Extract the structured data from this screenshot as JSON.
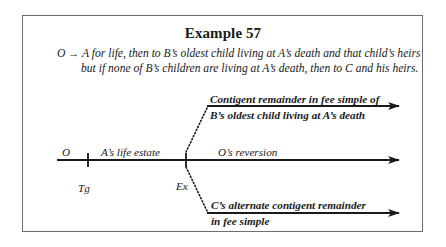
{
  "title": "Example 57",
  "conveyance": {
    "grantor": "O",
    "arrow_symbol": "→",
    "line1_rest": "A for life, then to B’s oldest child living at A’s death and that child’s heirs",
    "line2": "but if none of B’s children are living at A’s death, then to C and his heirs."
  },
  "timeline": {
    "start_label": "O",
    "segment1_label": "A’s life estate",
    "segment2_label": "O’s reversion",
    "event1_label": "Tg",
    "event2_label": "Ex",
    "upper_branch": {
      "line1": "Contigent remainder in fee simple of",
      "line2": "B’s oldest child living at A’s death"
    },
    "lower_branch": {
      "line1": "C’s alternate contigent remainder",
      "line2": "in fee simple"
    }
  },
  "colors": {
    "ink": "#1a1a1a",
    "frame": "#6e6e6e",
    "background": "#ffffff"
  }
}
